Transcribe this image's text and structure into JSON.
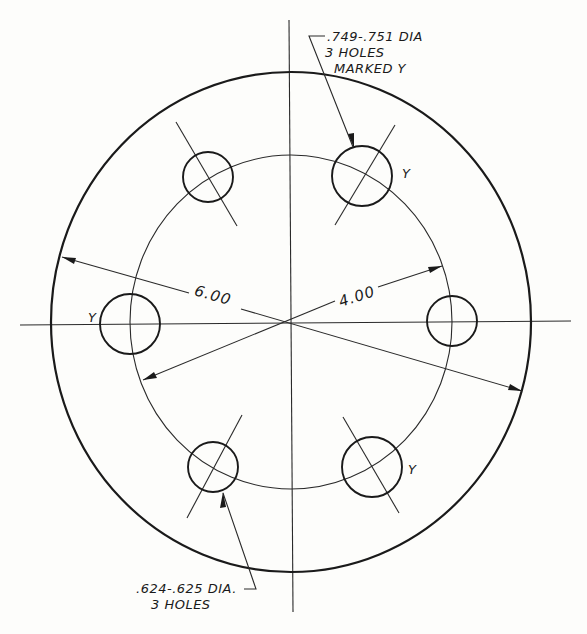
{
  "drawing": {
    "title": "Flange bolt-hole pattern",
    "outer_circle": {
      "cx": 291,
      "cy": 322,
      "rx": 240,
      "ry": 250
    },
    "bolt_circle": {
      "cx": 291,
      "cy": 322,
      "rx": 161,
      "ry": 167
    },
    "centerlines": {
      "horizontal": {
        "x1": 20,
        "y1": 325,
        "x2": 571,
        "y2": 321
      },
      "vertical": {
        "x1": 289,
        "y1": 20,
        "x2": 293,
        "y2": 612
      }
    },
    "holes": [
      {
        "id": "upper-right",
        "cx": 362,
        "cy": 176,
        "r": 30,
        "type": "large",
        "marked": true
      },
      {
        "id": "upper-left",
        "cx": 208,
        "cy": 177,
        "r": 25,
        "type": "small",
        "marked": false
      },
      {
        "id": "left",
        "cx": 130,
        "cy": 324,
        "r": 30,
        "type": "large",
        "marked": true
      },
      {
        "id": "right",
        "cx": 452,
        "cy": 321,
        "r": 25,
        "type": "small",
        "marked": false
      },
      {
        "id": "lower-left",
        "cx": 213,
        "cy": 467,
        "r": 25,
        "type": "small",
        "marked": false
      },
      {
        "id": "lower-right",
        "cx": 372,
        "cy": 467,
        "r": 30,
        "type": "large",
        "marked": true
      }
    ],
    "dimensions": {
      "outer_diameter": {
        "value": "6.00"
      },
      "bolt_circle_diameter": {
        "value": "4.00"
      }
    },
    "notes": {
      "large_holes": {
        "line1": ".749-.751 DIA",
        "line2": "3 HOLES",
        "line3": "MARKED  Y"
      },
      "small_holes": {
        "line1": ".624-.625 DIA.",
        "line2": "3 HOLES"
      }
    },
    "hole_marker": "Y"
  }
}
